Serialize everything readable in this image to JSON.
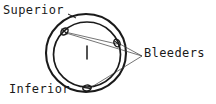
{
  "figure": {
    "type": "technical-line-drawing",
    "background_color": "#ffffff",
    "ink_color": "#1a1a1a"
  },
  "labels": {
    "superior": "Superior",
    "inferior": "Inferior",
    "bleeders": "Bleeders"
  },
  "icons": {
    "ring_outer": "outer-circle",
    "ring_inner": "inner-circle",
    "bleeder_mark": "bleeder-port-mark",
    "center_tick": "center-tick-mark",
    "leader_line": "leader-line",
    "chord_line": "chord-line"
  },
  "geometry": {
    "outer_circle": {
      "cx": 86,
      "cy": 53,
      "rx": 40,
      "ry": 39
    },
    "inner_circle": {
      "cx": 87,
      "cy": 54,
      "rx": 34,
      "ry": 33
    },
    "bleeders": [
      {
        "id": "upper-left",
        "x": 64,
        "y": 31
      },
      {
        "id": "right",
        "x": 116,
        "y": 42
      },
      {
        "id": "bottom",
        "x": 86,
        "y": 88
      }
    ],
    "leader_vertex": {
      "x": 142,
      "y": 56
    },
    "center_tick": {
      "x": 87,
      "y": 52,
      "length": 13
    },
    "chord": {
      "x1": 65,
      "y1": 32,
      "x2": 117,
      "y2": 44
    }
  }
}
